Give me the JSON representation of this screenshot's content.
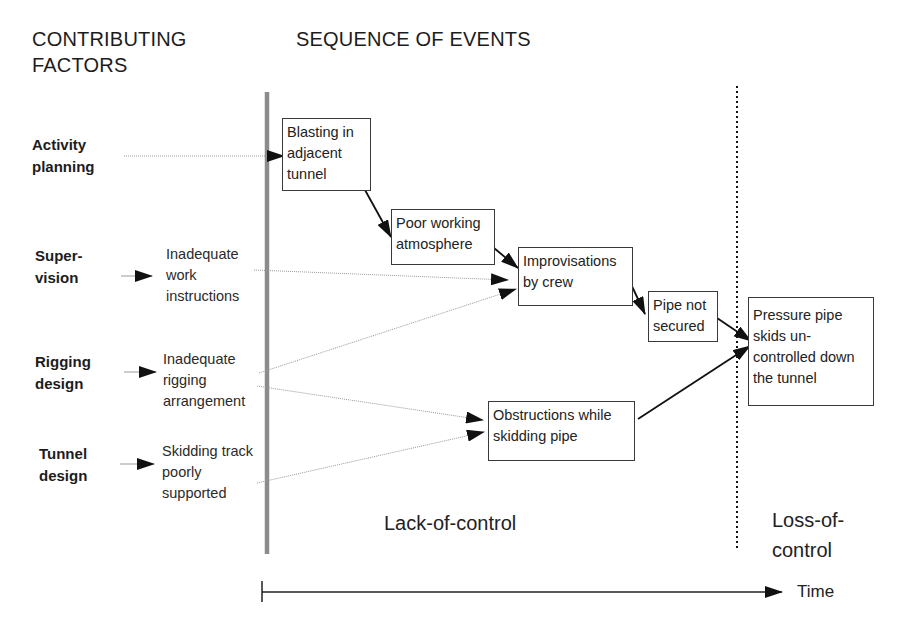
{
  "headers": {
    "contributing_factors": [
      "CONTRIBUTING",
      "FACTORS"
    ],
    "sequence_of_events": "SEQUENCE OF EVENTS"
  },
  "factors": [
    {
      "id": "activity-planning",
      "lines": [
        "Activity",
        "planning"
      ],
      "cause": null
    },
    {
      "id": "supervision",
      "lines": [
        "Super-",
        "vision"
      ],
      "cause": [
        "Inadequate",
        "work",
        "instructions"
      ]
    },
    {
      "id": "rigging-design",
      "lines": [
        "Rigging",
        "design"
      ],
      "cause": [
        "Inadequate",
        "rigging",
        "arrangement"
      ]
    },
    {
      "id": "tunnel-design",
      "lines": [
        "Tunnel",
        "design"
      ],
      "cause": [
        "Skidding track",
        "poorly",
        "supported"
      ]
    }
  ],
  "events": [
    {
      "id": "blasting",
      "lines": [
        "Blasting in",
        "adjacent",
        "tunnel"
      ]
    },
    {
      "id": "poor-atmosphere",
      "lines": [
        "Poor working",
        "atmosphere"
      ]
    },
    {
      "id": "improvisations",
      "lines": [
        "Improvisations",
        "by crew"
      ]
    },
    {
      "id": "pipe-not-secured",
      "lines": [
        "Pipe not",
        "secured"
      ]
    },
    {
      "id": "obstructions",
      "lines": [
        "Obstructions while",
        "skidding pipe"
      ]
    },
    {
      "id": "pressure-pipe-skids",
      "lines": [
        "Pressure pipe",
        "skids un-",
        "controlled down",
        "the tunnel"
      ]
    }
  ],
  "phases": {
    "lack_of_control": "Lack-of-control",
    "loss_of_control": [
      "Loss-of-",
      "control"
    ]
  },
  "time_axis": {
    "label": "Time"
  },
  "colors": {
    "line": "#1a1a1a",
    "divider_bar": "#8c8c8c",
    "dotted_connector": "#9a9a9a",
    "box_border": "#3a3a3a"
  }
}
